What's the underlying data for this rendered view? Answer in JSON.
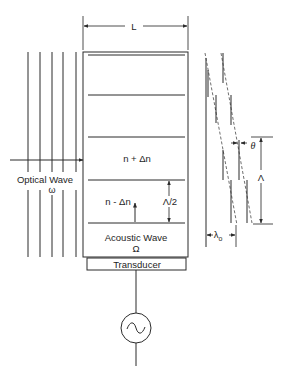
{
  "diagram": {
    "labels": {
      "length": "L",
      "optical_wave": "Optical Wave",
      "optical_freq": "ω",
      "high_index": "n + Δn",
      "low_index": "n - Δn",
      "half_wavelength": "Λ/2",
      "acoustic_wave": "Acoustic Wave",
      "acoustic_freq": "Ω",
      "transducer": "Transducer",
      "angle": "θ",
      "acoustic_wavelength": "Λ",
      "optical_wavelength": "λ",
      "optical_wavelength_sub": "o"
    },
    "components": {
      "optical_wavefronts_count": 5,
      "crystal_layers_count": 5,
      "source_symbol": "~"
    },
    "colors": {
      "line": "#2b2b2b",
      "text": "#1e1e1e",
      "background": "#ffffff"
    }
  }
}
